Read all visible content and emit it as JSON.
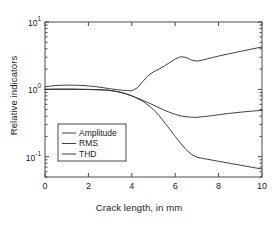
{
  "chart_data": {
    "type": "line",
    "title": "",
    "xlabel": "Crack length, in mm",
    "ylabel": "Relative indicators",
    "xlim": [
      0,
      10
    ],
    "ylim": [
      0.05,
      10
    ],
    "yscale": "log",
    "xscale": "linear",
    "grid": false,
    "legend_position": "lower-left",
    "xticks": [
      0,
      2,
      4,
      6,
      8,
      10
    ],
    "xtick_labels": [
      "0",
      "2",
      "4",
      "6",
      "8",
      "10"
    ],
    "yticks": [
      0.1,
      1,
      10
    ],
    "ytick_labels": [
      "10-1",
      "100",
      "101"
    ],
    "ytick_label_parts": [
      {
        "base": "10",
        "exp": "-1"
      },
      {
        "base": "10",
        "exp": "0"
      },
      {
        "base": "10",
        "exp": "1"
      }
    ],
    "line_color": "#2b2b2b",
    "axis_color": "#4a4a4a",
    "x": [
      0,
      0.25,
      0.5,
      0.75,
      1.0,
      1.25,
      1.5,
      1.75,
      2.0,
      2.25,
      2.5,
      2.75,
      3.0,
      3.25,
      3.5,
      3.75,
      4.0,
      4.25,
      4.5,
      4.75,
      5.0,
      5.25,
      5.5,
      5.75,
      6.0,
      6.25,
      6.5,
      6.75,
      7.0,
      7.25,
      7.5,
      7.75,
      8.0,
      8.25,
      8.5,
      8.75,
      9.0,
      9.25,
      9.5,
      9.75,
      10.0
    ],
    "series": [
      {
        "name": "Amplitude",
        "values": [
          1.09,
          1.12,
          1.14,
          1.15,
          1.155,
          1.155,
          1.15,
          1.14,
          1.125,
          1.105,
          1.08,
          1.05,
          1.02,
          0.995,
          0.975,
          0.96,
          0.955,
          1.05,
          1.3,
          1.6,
          1.82,
          2.0,
          2.22,
          2.5,
          2.82,
          3.05,
          2.98,
          2.72,
          2.62,
          2.72,
          2.85,
          2.98,
          3.12,
          3.25,
          3.38,
          3.52,
          3.66,
          3.8,
          3.95,
          4.1,
          4.25
        ]
      },
      {
        "name": "RMS",
        "values": [
          1.0,
          1.0,
          1.0,
          1.0,
          1.0,
          1.0,
          1.0,
          1.0,
          1.0,
          0.995,
          0.99,
          0.98,
          0.965,
          0.94,
          0.9,
          0.855,
          0.8,
          0.745,
          0.69,
          0.635,
          0.585,
          0.535,
          0.49,
          0.455,
          0.425,
          0.405,
          0.392,
          0.385,
          0.385,
          0.392,
          0.4,
          0.41,
          0.42,
          0.43,
          0.44,
          0.449,
          0.458,
          0.466,
          0.474,
          0.481,
          0.488
        ]
      },
      {
        "name": "THD",
        "values": [
          1.0,
          1.005,
          1.01,
          1.012,
          1.012,
          1.01,
          1.005,
          1.0,
          0.995,
          0.99,
          0.985,
          0.975,
          0.96,
          0.935,
          0.9,
          0.855,
          0.8,
          0.735,
          0.665,
          0.585,
          0.5,
          0.41,
          0.325,
          0.255,
          0.2,
          0.158,
          0.128,
          0.108,
          0.0985,
          0.0945,
          0.0915,
          0.0885,
          0.0855,
          0.0828,
          0.08,
          0.0775,
          0.075,
          0.0725,
          0.07,
          0.0678,
          0.0655
        ]
      }
    ]
  },
  "legend": {
    "items": [
      {
        "label": "Amplitude"
      },
      {
        "label": "RMS"
      },
      {
        "label": "THD"
      }
    ]
  }
}
